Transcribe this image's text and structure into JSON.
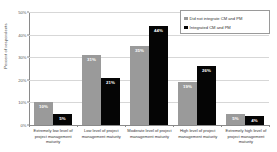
{
  "chart_data": {
    "type": "bar",
    "title": "",
    "xlabel": "",
    "ylabel": "Percent of respondents",
    "ylim": [
      0,
      50
    ],
    "yticks": [
      "0%",
      "10%",
      "20%",
      "30%",
      "40%",
      "50%"
    ],
    "ytick_values": [
      0,
      10,
      20,
      30,
      40,
      50
    ],
    "grid": true,
    "legend_position": "top-right",
    "categories": [
      "Extremely low level of project management maturity",
      "Low level of project management maturity",
      "Moderate level of project management maturity",
      "High level of project management maturity",
      "Extremely high level of project management maturity"
    ],
    "series": [
      {
        "name": "Did not integrate CM and PM",
        "color": "#9a9a9a",
        "values": [
          10,
          31,
          35,
          19,
          5
        ],
        "labels": [
          "10%",
          "31%",
          "35%",
          "19%",
          "5%"
        ]
      },
      {
        "name": "Integrated CM and PM",
        "color": "#050505",
        "values": [
          5,
          21,
          44,
          26,
          4
        ],
        "labels": [
          "5%",
          "21%",
          "44%",
          "26%",
          "4%"
        ]
      }
    ]
  }
}
